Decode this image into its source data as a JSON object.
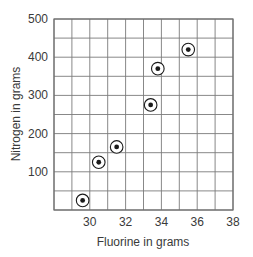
{
  "chart_data": {
    "type": "scatter",
    "title": "",
    "xlabel": "Fluorine in grams",
    "ylabel": "Nitrogen in grams",
    "xlim": [
      28,
      38
    ],
    "ylim": [
      0,
      500
    ],
    "x_ticks": [
      30,
      32,
      34,
      36,
      38
    ],
    "y_ticks": [
      100,
      200,
      300,
      400,
      500
    ],
    "x_grid_step": 1,
    "y_grid_step": 50,
    "grid": true,
    "legend": null,
    "marker": "circled-dot",
    "series": [
      {
        "name": "data",
        "points": [
          {
            "x": 29.6,
            "y": 25
          },
          {
            "x": 30.5,
            "y": 125
          },
          {
            "x": 31.5,
            "y": 165
          },
          {
            "x": 33.4,
            "y": 275
          },
          {
            "x": 33.8,
            "y": 370
          },
          {
            "x": 35.5,
            "y": 420
          }
        ]
      }
    ]
  },
  "colors": {
    "grid": "#7a7a7a",
    "frame": "#6f6f6f",
    "marker": "#1a1a1a",
    "text": "#3a3a3a"
  }
}
